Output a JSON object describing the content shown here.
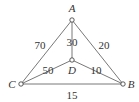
{
  "graph": {
    "nodes": [
      {
        "id": "A",
        "label": "A",
        "x": 72,
        "y": 20,
        "lx": 72,
        "ly": 12
      },
      {
        "id": "B",
        "label": "B",
        "x": 123,
        "y": 84,
        "lx": 131,
        "ly": 88
      },
      {
        "id": "C",
        "label": "C",
        "x": 21,
        "y": 84,
        "lx": 12,
        "ly": 88
      },
      {
        "id": "D",
        "label": "D",
        "x": 72,
        "y": 60,
        "lx": 72,
        "ly": 74
      }
    ],
    "edges": [
      {
        "from": "A",
        "to": "C",
        "weight": "70",
        "lx": 40,
        "ly": 49
      },
      {
        "from": "A",
        "to": "B",
        "weight": "20",
        "lx": 104,
        "ly": 49
      },
      {
        "from": "A",
        "to": "D",
        "weight": "30",
        "lx": 72,
        "ly": 46
      },
      {
        "from": "C",
        "to": "D",
        "weight": "50",
        "lx": 48,
        "ly": 74
      },
      {
        "from": "D",
        "to": "B",
        "weight": "10",
        "lx": 96,
        "ly": 74
      },
      {
        "from": "C",
        "to": "B",
        "weight": "15",
        "lx": 72,
        "ly": 99
      }
    ]
  }
}
